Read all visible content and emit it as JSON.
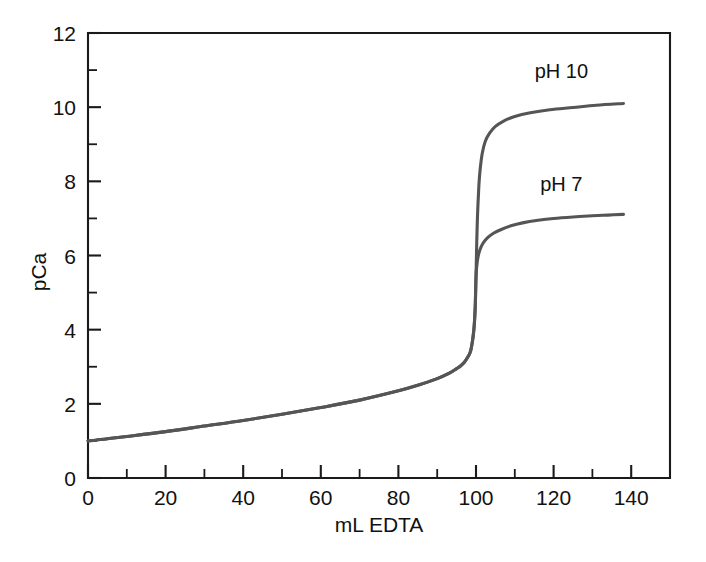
{
  "chart_data": {
    "type": "line",
    "title": "",
    "subtitle": "",
    "xlabel": "mL EDTA",
    "ylabel": "pCa",
    "xlim": [
      0,
      150
    ],
    "ylim": [
      0,
      12
    ],
    "grid": false,
    "legend_position": "inline-curve-labels",
    "x_ticks_major": [
      0,
      20,
      40,
      60,
      80,
      100,
      120,
      140
    ],
    "x_tick_labels": [
      "0",
      "20",
      "40",
      "60",
      "80",
      "100",
      "120",
      "140"
    ],
    "x_ticks_minor": [
      10,
      30,
      50,
      70,
      90,
      110,
      130,
      150
    ],
    "y_ticks_major": [
      0,
      2,
      4,
      6,
      8,
      10,
      12
    ],
    "y_tick_labels": [
      "0",
      "2",
      "4",
      "6",
      "8",
      "10",
      "12"
    ],
    "y_ticks_minor": [
      1,
      3,
      5,
      7,
      9,
      11
    ],
    "equivalence_point_ml": 100,
    "annotations": [
      {
        "text": "pH 10",
        "x": 122,
        "y": 10.8
      },
      {
        "text": "pH 7",
        "x": 122,
        "y": 7.75
      }
    ],
    "series": [
      {
        "name": "pH 10",
        "label": "pH 10",
        "color": "#555555",
        "x": [
          0,
          2,
          5,
          10,
          20,
          30,
          40,
          50,
          60,
          70,
          80,
          85,
          90,
          93,
          95,
          96,
          97,
          98,
          98.6,
          99.1,
          99.4,
          99.6,
          99.8,
          99.9,
          100,
          100.1,
          100.2,
          100.4,
          100.7,
          101,
          101.6,
          102.4,
          103.5,
          105,
          107,
          110,
          114,
          119,
          125,
          131,
          138
        ],
        "y": [
          1.0,
          1.02,
          1.06,
          1.12,
          1.25,
          1.4,
          1.55,
          1.72,
          1.9,
          2.1,
          2.35,
          2.5,
          2.68,
          2.82,
          2.95,
          3.02,
          3.12,
          3.28,
          3.42,
          3.7,
          3.95,
          4.2,
          4.6,
          5.0,
          5.42,
          5.9,
          6.4,
          7.1,
          7.8,
          8.25,
          8.75,
          9.08,
          9.3,
          9.48,
          9.62,
          9.75,
          9.85,
          9.93,
          9.99,
          10.05,
          10.1
        ]
      },
      {
        "name": "pH 7",
        "label": "pH 7",
        "color": "#555555",
        "x": [
          0,
          2,
          5,
          10,
          20,
          30,
          40,
          50,
          60,
          70,
          80,
          85,
          90,
          93,
          95,
          96,
          97,
          98,
          98.6,
          99.1,
          99.4,
          99.6,
          99.8,
          99.9,
          100,
          100.2,
          100.5,
          101,
          101.8,
          103,
          104.5,
          106.5,
          109,
          112,
          116,
          120,
          125,
          130,
          134,
          138
        ],
        "y": [
          1.0,
          1.02,
          1.06,
          1.12,
          1.25,
          1.4,
          1.55,
          1.72,
          1.9,
          2.1,
          2.35,
          2.5,
          2.68,
          2.82,
          2.95,
          3.02,
          3.12,
          3.28,
          3.42,
          3.7,
          3.95,
          4.2,
          4.6,
          5.0,
          5.42,
          5.72,
          5.95,
          6.15,
          6.33,
          6.48,
          6.6,
          6.7,
          6.8,
          6.88,
          6.95,
          7.0,
          7.04,
          7.07,
          7.09,
          7.11
        ]
      }
    ]
  }
}
